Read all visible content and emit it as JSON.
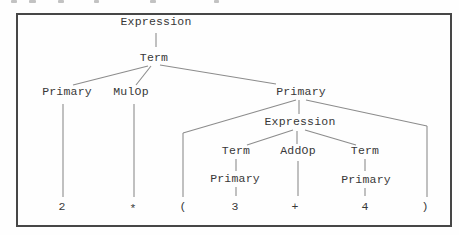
{
  "figure": {
    "background": "#fefefe",
    "border_color": "#474747",
    "line_color": "#8c8c8c",
    "text_color": "#383838",
    "border_rect": {
      "x": 16,
      "y": 13,
      "w": 436,
      "h": 214
    }
  },
  "tree": {
    "description": "parse-tree-for-2-times-open-paren-3-plus-4-close-paren",
    "nodes": [
      {
        "id": "expression-root",
        "label": "Expression",
        "x": 156,
        "y": 22,
        "leaf": false
      },
      {
        "id": "term-root",
        "label": "Term",
        "x": 154,
        "y": 58,
        "leaf": false
      },
      {
        "id": "primary-left",
        "label": "Primary",
        "x": 67,
        "y": 92,
        "leaf": false
      },
      {
        "id": "mulop",
        "label": "MulOp",
        "x": 131,
        "y": 92,
        "leaf": false
      },
      {
        "id": "primary-right",
        "label": "Primary",
        "x": 301,
        "y": 92,
        "leaf": false
      },
      {
        "id": "expression-inner",
        "label": "Expression",
        "x": 300,
        "y": 122,
        "leaf": false
      },
      {
        "id": "term-inner-left",
        "label": "Term",
        "x": 236,
        "y": 151,
        "leaf": false
      },
      {
        "id": "addop",
        "label": "AddOp",
        "x": 298,
        "y": 151,
        "leaf": false
      },
      {
        "id": "term-inner-right",
        "label": "Term",
        "x": 365,
        "y": 151,
        "leaf": false
      },
      {
        "id": "primary-inner-left",
        "label": "Primary",
        "x": 235,
        "y": 179,
        "leaf": false
      },
      {
        "id": "primary-inner-right",
        "label": "Primary",
        "x": 366,
        "y": 180,
        "leaf": false
      },
      {
        "id": "leaf-2",
        "label": "2",
        "x": 62,
        "y": 207,
        "leaf": true
      },
      {
        "id": "leaf-star",
        "label": "*",
        "x": 133,
        "y": 209,
        "leaf": true
      },
      {
        "id": "leaf-lparen",
        "label": "(",
        "x": 183,
        "y": 207,
        "leaf": true
      },
      {
        "id": "leaf-3",
        "label": "3",
        "x": 235,
        "y": 207,
        "leaf": true
      },
      {
        "id": "leaf-plus",
        "label": "+",
        "x": 295,
        "y": 207,
        "leaf": true
      },
      {
        "id": "leaf-4",
        "label": "4",
        "x": 365,
        "y": 207,
        "leaf": true
      },
      {
        "id": "leaf-rparen",
        "label": ")",
        "x": 425,
        "y": 207,
        "leaf": true
      }
    ],
    "edges": [
      {
        "name": "edge-expression-term",
        "x1": 156,
        "y1": 33,
        "x2": 156,
        "y2": 47
      },
      {
        "name": "edge-term-primary-left",
        "x1": 148,
        "y1": 66,
        "x2": 73,
        "y2": 85
      },
      {
        "name": "edge-term-mulop",
        "x1": 151,
        "y1": 66,
        "x2": 136,
        "y2": 85
      },
      {
        "name": "edge-term-primary-right",
        "x1": 160,
        "y1": 65,
        "x2": 276,
        "y2": 84
      },
      {
        "name": "edge-primary-left-2",
        "x1": 63,
        "y1": 104,
        "x2": 63,
        "y2": 197
      },
      {
        "name": "edge-mulop-star",
        "x1": 134,
        "y1": 104,
        "x2": 134,
        "y2": 197
      },
      {
        "name": "edge-primary-right-lparen-diag",
        "x1": 296,
        "y1": 100,
        "x2": 183,
        "y2": 133
      },
      {
        "name": "edge-primary-right-lparen-drop",
        "x1": 183,
        "y1": 133,
        "x2": 183,
        "y2": 197
      },
      {
        "name": "edge-primary-right-expression",
        "x1": 299,
        "y1": 100,
        "x2": 299,
        "y2": 114
      },
      {
        "name": "edge-primary-right-rparen-diag",
        "x1": 306,
        "y1": 100,
        "x2": 427,
        "y2": 126
      },
      {
        "name": "edge-primary-right-rparen-drop",
        "x1": 427,
        "y1": 126,
        "x2": 427,
        "y2": 197
      },
      {
        "name": "edge-expression-term-left",
        "x1": 293,
        "y1": 130,
        "x2": 247,
        "y2": 145
      },
      {
        "name": "edge-expression-addop",
        "x1": 297,
        "y1": 131,
        "x2": 297,
        "y2": 144
      },
      {
        "name": "edge-expression-term-right",
        "x1": 305,
        "y1": 130,
        "x2": 356,
        "y2": 145
      },
      {
        "name": "edge-term-left-primary",
        "x1": 236,
        "y1": 159,
        "x2": 236,
        "y2": 171
      },
      {
        "name": "edge-primary-left-inner-3",
        "x1": 236,
        "y1": 187,
        "x2": 236,
        "y2": 196
      },
      {
        "name": "edge-addop-plus",
        "x1": 298,
        "y1": 161,
        "x2": 298,
        "y2": 196
      },
      {
        "name": "edge-term-right-primary",
        "x1": 365,
        "y1": 159,
        "x2": 365,
        "y2": 171
      },
      {
        "name": "edge-primary-right-inner-4",
        "x1": 365,
        "y1": 188,
        "x2": 365,
        "y2": 196
      }
    ]
  },
  "top_remnants": [
    {
      "x": 11,
      "w": 6
    },
    {
      "x": 29,
      "w": 7
    },
    {
      "x": 58,
      "w": 6
    },
    {
      "x": 94,
      "w": 5
    },
    {
      "x": 150,
      "w": 6
    },
    {
      "x": 214,
      "w": 5
    }
  ]
}
